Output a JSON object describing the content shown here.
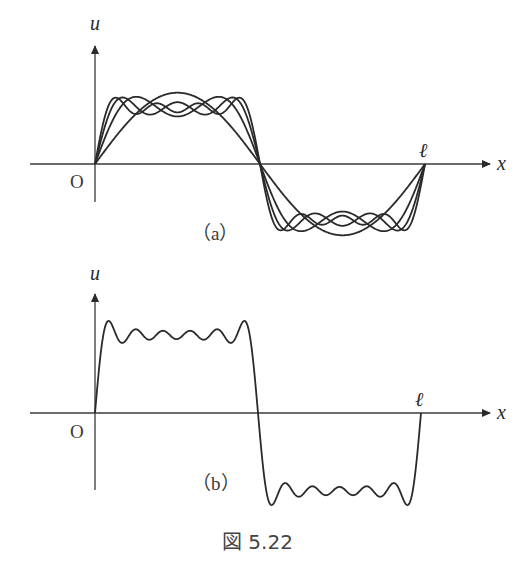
{
  "figure": {
    "caption": "図 5.22"
  },
  "panel_a": {
    "label": "（a）",
    "y_axis_label": "u",
    "x_axis_label": "x",
    "origin_label": "O",
    "end_label": "ℓ",
    "description": "Fourier partial sums (1, 3, 5, 7 odd-harmonic terms) of a square wave on [0, ℓ], overlaid",
    "partial_sum_terms": [
      1,
      2,
      3,
      4
    ]
  },
  "panel_b": {
    "label": "（b）",
    "y_axis_label": "u",
    "x_axis_label": "x",
    "origin_label": "O",
    "end_label": "ℓ",
    "description": "Higher-order Fourier partial sum of a square wave showing Gibbs overshoot",
    "partial_sum_terms": 6
  },
  "colors": {
    "curve": "#2a2a2a",
    "axis": "#3a3a3a",
    "background": "#ffffff"
  }
}
